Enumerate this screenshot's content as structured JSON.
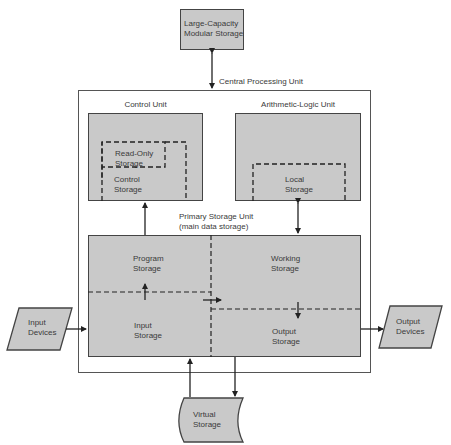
{
  "diagram": {
    "external_storage": {
      "line1": "Large-Capacity",
      "line2": "Modular Storage"
    },
    "cpu": {
      "label": "Central Processing Unit"
    },
    "control_unit": {
      "title": "Control Unit",
      "read_only": {
        "line1": "Read-Only",
        "line2": "Storage"
      },
      "control_storage": {
        "line1": "Control",
        "line2": "Storage"
      }
    },
    "alu": {
      "title": "Arithmetic-Logic Unit",
      "local_storage": {
        "line1": "Local",
        "line2": "Storage"
      }
    },
    "primary_storage": {
      "title": "Primary Storage Unit",
      "subtitle": "(main data storage)",
      "program": {
        "line1": "Program",
        "line2": "Storage"
      },
      "working": {
        "line1": "Working",
        "line2": "Storage"
      },
      "input": {
        "line1": "Input",
        "line2": "Storage"
      },
      "output": {
        "line1": "Output",
        "line2": "Storage"
      }
    },
    "input_devices": {
      "line1": "Input",
      "line2": "Devices"
    },
    "output_devices": {
      "line1": "Output",
      "line2": "Devices"
    },
    "virtual_storage": {
      "line1": "Virtual",
      "line2": "Storage"
    },
    "colors": {
      "fill": "#c9c9c9",
      "stroke": "#444444"
    }
  }
}
